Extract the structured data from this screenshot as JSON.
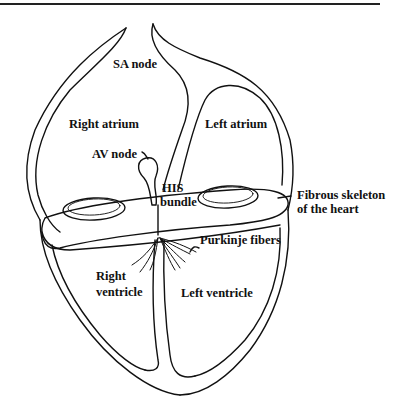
{
  "figure": {
    "labels": {
      "sa_node": "SA node",
      "right_atrium": "Right atrium",
      "left_atrium": "Left atrium",
      "av_node": "AV node",
      "his_line1": "HIS",
      "his_line2": "bundle",
      "fibrous_line1": "Fibrous skeleton",
      "fibrous_line2": "of the heart",
      "purkinje": "Purkinje fibers",
      "right_ventricle_line1": "Right",
      "right_ventricle_line2": "ventricle",
      "left_ventricle": "Left ventricle"
    },
    "colors": {
      "line": "#111111",
      "background": "#ffffff"
    }
  }
}
